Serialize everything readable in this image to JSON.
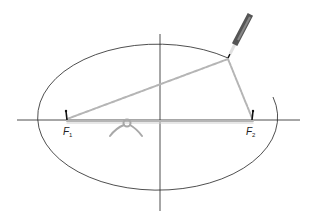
{
  "diagram": {
    "foci": [
      {
        "label": "F",
        "subscript": "1",
        "x": 67,
        "y": 120
      },
      {
        "label": "F",
        "subscript": "2",
        "x": 253,
        "y": 120
      }
    ],
    "axes": {
      "horizontal": {
        "x1": 17,
        "x2": 300,
        "y": 120
      },
      "vertical": {
        "x": 160,
        "y1": 34,
        "y2": 211
      }
    },
    "ellipse": {
      "cx": 158,
      "cy": 121,
      "rx": 120,
      "ry": 73
    },
    "pencil_tip": {
      "x": 228,
      "y": 58
    },
    "colors": {
      "line": "#222222",
      "string": "#b8b8b8",
      "pencil_dark": "#555555",
      "pencil_light": "#dddddd"
    }
  }
}
